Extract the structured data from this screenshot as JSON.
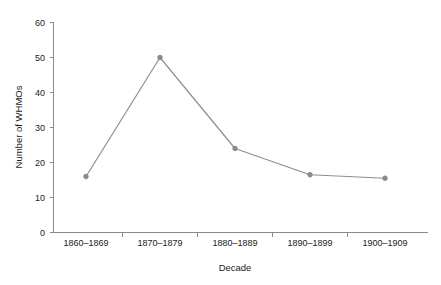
{
  "chart_data": {
    "type": "line",
    "title": "",
    "subtitle": "",
    "xlabel": "Decade",
    "ylabel": "Number of WHMOs",
    "categories": [
      "1860–1869",
      "1870–1879",
      "1880–1889",
      "1890–1899",
      "1900–1909"
    ],
    "values": [
      16,
      50,
      24,
      16.5,
      15.5
    ],
    "series": [
      {
        "name": "Number of WHMOs",
        "values": [
          16,
          50,
          24,
          16.5,
          15.5
        ]
      }
    ],
    "ylim": [
      0,
      60
    ],
    "yticks": [
      0,
      10,
      20,
      30,
      40,
      50,
      60
    ],
    "ytick_labels": [
      "0",
      "10",
      "20",
      "30",
      "40",
      "50",
      "60"
    ],
    "xtick_labels": [
      "1860–1869",
      "1870–1879",
      "1880–1889",
      "1890–1899",
      "1900–1909"
    ],
    "grid": false,
    "legend": false,
    "legend_position": "none",
    "marker": "circle",
    "line_color": "#8f8f8f",
    "marker_color": "#8a8a8a",
    "axis_color": "#8a8a8a",
    "background_color": "#ffffff",
    "text_color": "#1a1a1a"
  }
}
